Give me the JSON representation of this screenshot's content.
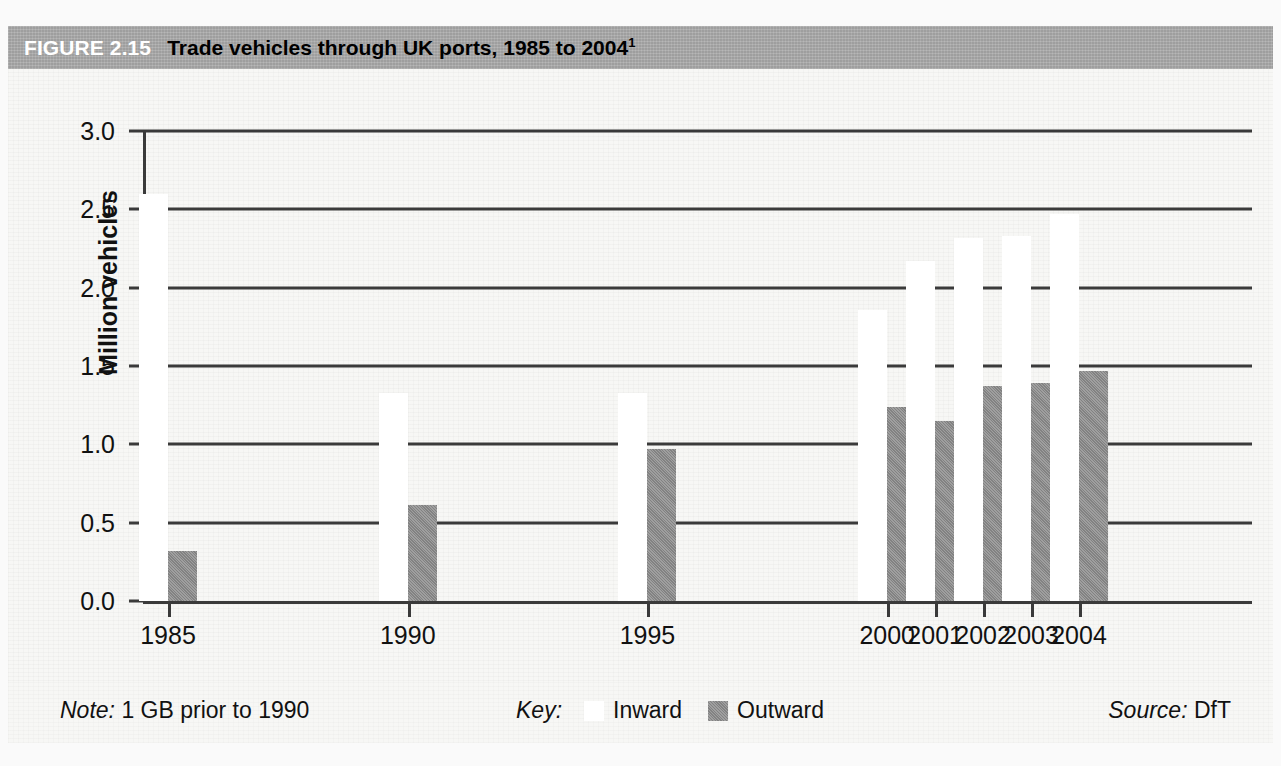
{
  "figure": {
    "number": "FIGURE 2.15",
    "title": "Trade vehicles through UK ports, 1985 to 2004",
    "title_superscript": "1"
  },
  "footer": {
    "note_lead": "Note:",
    "note_text": "1 GB prior to 1990",
    "key_lead": "Key:",
    "source_lead": "Source:",
    "source_text": "DfT"
  },
  "chart_data": {
    "type": "bar",
    "title": "Trade vehicles through UK ports, 1985 to 2004",
    "xlabel": "",
    "ylabel": "Million vehicles",
    "ylim": [
      0.0,
      3.0
    ],
    "ytick_step": 0.5,
    "ytick_labels": [
      "0.0",
      "0.5",
      "1.0",
      "1.5",
      "2.0",
      "2.5",
      "3.0"
    ],
    "ytick_values": [
      0.0,
      0.5,
      1.0,
      1.5,
      2.0,
      2.5,
      3.0
    ],
    "grid": true,
    "legend_position": "bottom-center",
    "categories": [
      "1985",
      "1990",
      "1995",
      "2000",
      "2001",
      "2002",
      "2003",
      "2004"
    ],
    "category_positions": [
      0,
      5,
      10,
      15,
      16,
      17,
      18,
      19
    ],
    "series": [
      {
        "name": "Inward",
        "color": "#ffffff",
        "values": [
          2.6,
          1.33,
          1.33,
          1.86,
          2.17,
          2.32,
          2.33,
          2.47
        ]
      },
      {
        "name": "Outward",
        "color": "#8a8a8a",
        "values": [
          0.32,
          0.61,
          0.97,
          1.24,
          1.15,
          1.37,
          1.39,
          1.47
        ]
      }
    ]
  }
}
